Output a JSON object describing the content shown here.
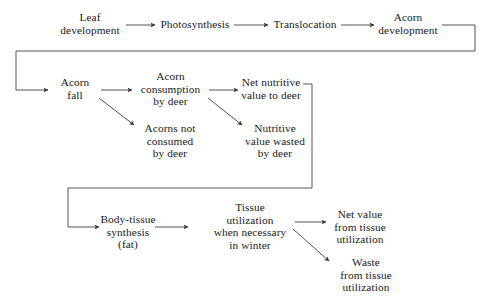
{
  "diagram": {
    "line_color": "#4a4a4a",
    "text_color": "#1a1a1a",
    "background": "#ffffff",
    "nodes": {
      "leaf_development": "Leaf\ndevelopment",
      "photosynthesis": "Photosynthesis",
      "translocation": "Translocation",
      "acorn_development": "Acorn\ndevelopment",
      "acorn_fall": "Acorn\nfall",
      "acorn_consumption": "Acorn\nconsumption\nby deer",
      "net_nutritive_value": "Net nutritive\nvalue to deer",
      "acorns_not_consumed": "Acorns not\nconsumed\nby deer",
      "nutritive_value_wasted": "Nutritive\nvalue wasted\nby deer",
      "body_tissue_synthesis": "Body-tissue\nsynthesis\n(fat)",
      "tissue_utilization": "Tissue\nutilization\nwhen necessary\nin winter",
      "net_value_tissue": "Net value\nfrom tissue\nutilization",
      "waste_from_tissue": "Waste\nfrom tissue\nutilization"
    }
  }
}
